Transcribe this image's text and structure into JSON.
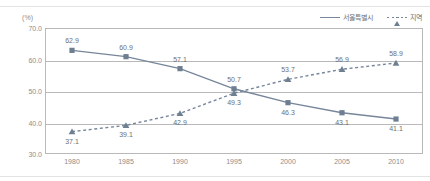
{
  "unit_label": "(%)",
  "legend": {
    "position": "top-right",
    "entries": [
      {
        "label": "서울특별시",
        "style": "solid",
        "marker": "square-marker-icon"
      },
      {
        "label": "지역",
        "style": "dashed",
        "marker": "triangle-marker-icon"
      }
    ]
  },
  "axes": {
    "y_ticks": [
      "70.0",
      "60.0",
      "50.0",
      "40.0",
      "30.0"
    ],
    "x_ticks": [
      "1980",
      "1985",
      "1990",
      "1995",
      "2000",
      "2005",
      "2010"
    ]
  },
  "colors": {
    "series": "#77869a",
    "marker": "#6e7f92",
    "grid": "#b9b9b9",
    "text": "#8d8d8d",
    "label_text": "#6f6f6f"
  },
  "chart_data": {
    "type": "line",
    "title": "",
    "xlabel": "",
    "ylabel": "(%)",
    "ylim": [
      30.0,
      70.0
    ],
    "ygrid": [
      30.0,
      40.0,
      50.0,
      60.0,
      70.0
    ],
    "grid": true,
    "legend_position": "top-right",
    "categories": [
      "1980",
      "1985",
      "1990",
      "1995",
      "2000",
      "2005",
      "2010"
    ],
    "series": [
      {
        "name": "서울특별시",
        "line_style": "solid",
        "marker": "square",
        "values": [
          62.9,
          60.9,
          57.1,
          50.7,
          46.3,
          43.1,
          41.1
        ],
        "labels": [
          "62.9",
          "60.9",
          "57.1",
          "50.7",
          "46.3",
          "43.1",
          "41.1"
        ],
        "label_positions": [
          "above",
          "above",
          "above",
          "above",
          "below",
          "below",
          "below"
        ]
      },
      {
        "name": "지역",
        "line_style": "dashed",
        "marker": "triangle",
        "values": [
          37.1,
          39.1,
          42.9,
          49.3,
          53.7,
          56.9,
          58.9
        ],
        "labels": [
          "37.1",
          "39.1",
          "42.9",
          "49.3",
          "53.7",
          "56.9",
          "58.9"
        ],
        "label_positions": [
          "below",
          "below",
          "below",
          "below",
          "above",
          "above",
          "above"
        ]
      }
    ]
  }
}
